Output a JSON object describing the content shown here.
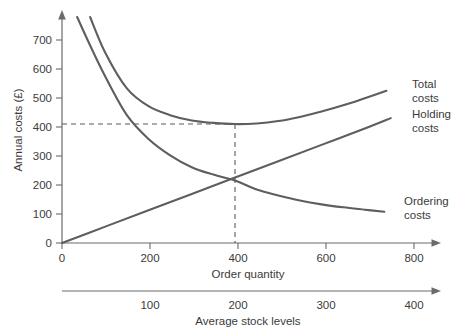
{
  "chart_data": {
    "type": "line",
    "title": "",
    "subtitle": "",
    "ylabel": "Annual costs (£)",
    "xlabel": "Order quantity",
    "secondary_xlabel": "Average stock levels",
    "ylim": [
      0,
      760
    ],
    "xlim": [
      0,
      860
    ],
    "yticks": [
      0,
      100,
      200,
      300,
      400,
      500,
      600,
      700
    ],
    "ytick_labels": [
      "0",
      "100",
      "200",
      "300",
      "400",
      "500",
      "600",
      "700"
    ],
    "xticks": [
      0,
      200,
      400,
      600,
      800
    ],
    "xtick_labels": [
      "0",
      "200",
      "400",
      "600",
      "800"
    ],
    "secondary_xticks": [
      100,
      200,
      300,
      400
    ],
    "secondary_xtick_labels": [
      "100",
      "200",
      "300",
      "400"
    ],
    "grid": false,
    "legend_position": "right-inline",
    "series": [
      {
        "name": "Total costs",
        "label_line1": "Total",
        "label_line2": "costs",
        "color": "#5e5e5e",
        "x": [
          65,
          100,
          150,
          200,
          250,
          300,
          350,
          400,
          450,
          500,
          550,
          600,
          650,
          700,
          750
        ],
        "values": [
          760,
          640,
          520,
          460,
          430,
          412,
          404,
          400,
          402,
          410,
          424,
          442,
          463,
          487,
          512
        ]
      },
      {
        "name": "Holding costs",
        "label_line1": "Holding",
        "label_line2": "costs",
        "color": "#5e5e5e",
        "x": [
          0,
          100,
          200,
          300,
          400,
          500,
          600,
          700,
          760
        ],
        "values": [
          0,
          55,
          110,
          165,
          220,
          275,
          330,
          385,
          420
        ]
      },
      {
        "name": "Ordering costs",
        "label_line1": "Ordering",
        "label_line2": "costs",
        "color": "#5e5e5e",
        "x": [
          35,
          60,
          100,
          150,
          200,
          250,
          300,
          350,
          400,
          450,
          500,
          550,
          600,
          650,
          700,
          745
        ],
        "values": [
          760,
          680,
          560,
          430,
          350,
          295,
          255,
          230,
          210,
          180,
          160,
          143,
          130,
          120,
          112,
          105
        ]
      }
    ],
    "annotations": [
      {
        "name": "optimum-order-quantity",
        "type": "dashed-crosshair",
        "x": 400,
        "y": 400,
        "note": "dashed lines from y-axis at 400 to minimum of total cost curve at order quantity 400"
      }
    ],
    "intersection": {
      "name": "holding-ordering-crossover",
      "x": 400,
      "y": 215
    }
  },
  "axes": {
    "y_label": "Annual costs (£)",
    "x_label": "Order quantity",
    "secondary_label": "Average stock levels"
  }
}
